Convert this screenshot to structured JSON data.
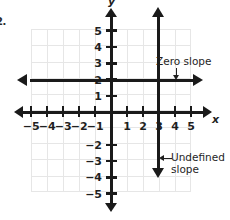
{
  "problem": {
    "number": "2."
  },
  "chart_data": {
    "type": "line",
    "title": "",
    "xlabel": "x",
    "ylabel": "y",
    "xlim": [
      -6,
      6
    ],
    "ylim": [
      -6,
      6
    ],
    "grid": true,
    "legend": "none",
    "x_ticks": [
      -5,
      -4,
      -3,
      -2,
      -1,
      1,
      2,
      3,
      4,
      5
    ],
    "y_ticks": [
      5,
      4,
      3,
      2,
      1,
      -2,
      -3,
      -4,
      -5
    ],
    "x_tick_labels": [
      "−5",
      "−4",
      "−3",
      "−2",
      "−1",
      "1",
      "2",
      "3",
      "4",
      "5"
    ],
    "y_tick_labels": [
      "5",
      "4",
      "3",
      "2",
      "1",
      "−2",
      "−3",
      "−4",
      "−5"
    ],
    "series": [
      {
        "name": "Zero slope",
        "equation": "y = 2",
        "orientation": "horizontal",
        "value": 2,
        "x_range": [
          -5,
          5.5
        ],
        "arrows": "both",
        "color": "#1a1a1a"
      },
      {
        "name": "Undefined slope",
        "equation": "x = 3",
        "orientation": "vertical",
        "value": 3,
        "y_range": [
          -4.5,
          6
        ],
        "arrows": "both",
        "color": "#1a1a1a"
      }
    ],
    "annotations": [
      {
        "id": "zero-slope",
        "text": "Zero slope",
        "points_to": "horizontal line y = 2",
        "arrow_direction": "down"
      },
      {
        "id": "undefined-slope",
        "text": "Undefined\nslope",
        "points_to": "vertical line x = 3",
        "arrow_direction": "left"
      }
    ],
    "colors": {
      "axis": "#1a1a1a",
      "grid": "#e6e6e6",
      "background": "#ffffff",
      "text": "#1f1f1f"
    }
  }
}
